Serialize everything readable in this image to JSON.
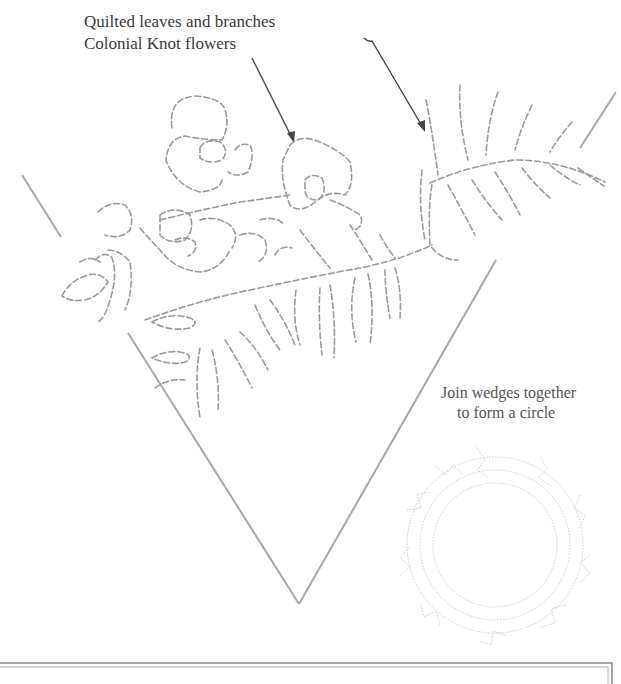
{
  "labels": {
    "line1": "Quilted leaves and branches",
    "line2": "Colonial Knot flowers",
    "join_line1": "Join wedges together",
    "join_line2": "to form a circle"
  },
  "pattern": {
    "wedge_apex": [
      299,
      604
    ],
    "wedge_left_start": [
      128,
      333
    ],
    "wedge_right_start": [
      496,
      260
    ],
    "outer_left_segment": [
      [
        22,
        175
      ],
      [
        61,
        237
      ]
    ],
    "outer_right_segment": [
      [
        616,
        92
      ],
      [
        578,
        150
      ]
    ],
    "stitch_color": "#9a9a9a",
    "wedge_color": "#a8a8a8",
    "arrow_color": "#444444"
  },
  "frame": {
    "top_y": 664,
    "right_x": 611
  }
}
